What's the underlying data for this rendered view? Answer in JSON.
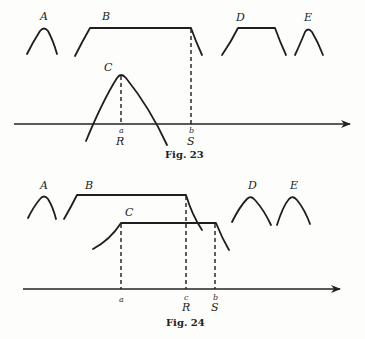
{
  "figures": [
    {
      "caption": "Fig. 23",
      "curve_labels": {
        "A": "A",
        "B": "B",
        "C": "C",
        "D": "D",
        "E": "E"
      },
      "axis_marks": [
        {
          "letter": "a",
          "name": "R"
        },
        {
          "letter": "b",
          "name": "S"
        }
      ]
    },
    {
      "caption": "Fig. 24",
      "curve_labels": {
        "A": "A",
        "B": "B",
        "C": "C",
        "D": "D",
        "E": "E"
      },
      "axis_marks": [
        {
          "letter": "a",
          "name": ""
        },
        {
          "letter": "c",
          "name": "R"
        },
        {
          "letter": "b",
          "name": "S"
        }
      ]
    }
  ],
  "colors": {
    "ink": "#1e1e1e",
    "paper": "#fdfdfc"
  }
}
